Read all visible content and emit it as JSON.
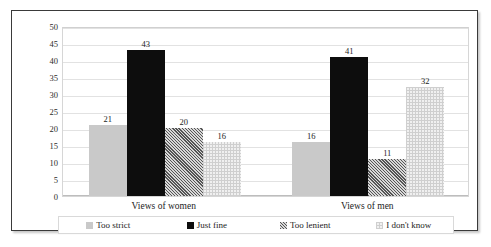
{
  "chart_data": {
    "type": "bar",
    "title": "",
    "subtitle": "",
    "xlabel": "",
    "ylabel": "",
    "ylim": [
      0,
      50
    ],
    "ytick_step": 5,
    "yticks": [
      "50",
      "45",
      "40",
      "35",
      "30",
      "25",
      "20",
      "15",
      "10",
      "5",
      "0"
    ],
    "grid": true,
    "legend_position": "bottom",
    "categories": [
      "Views of women",
      "Views of men"
    ],
    "series": [
      {
        "name": "Too strict",
        "values": [
          21,
          16
        ],
        "swatch": "light-gray-solid",
        "color": "#c9c9c9"
      },
      {
        "name": "Just fine",
        "values": [
          43,
          41
        ],
        "swatch": "black-solid",
        "color": "#0d0d0d"
      },
      {
        "name": "Too lenient",
        "values": [
          20,
          11
        ],
        "swatch": "dark-hatch",
        "color": "#7a7a7a"
      },
      {
        "name": "I don't know",
        "values": [
          16,
          32
        ],
        "swatch": "light-dotted",
        "color": "#ededed"
      }
    ],
    "data_labels": {
      "Views of women": [
        "21",
        "43",
        "20",
        "16"
      ],
      "Views of men": [
        "16",
        "41",
        "11",
        "32"
      ]
    }
  },
  "legend": {
    "items": [
      {
        "label": "Too strict"
      },
      {
        "label": "Just fine"
      },
      {
        "label": "Too lenient"
      },
      {
        "label": "I don't know"
      }
    ]
  }
}
